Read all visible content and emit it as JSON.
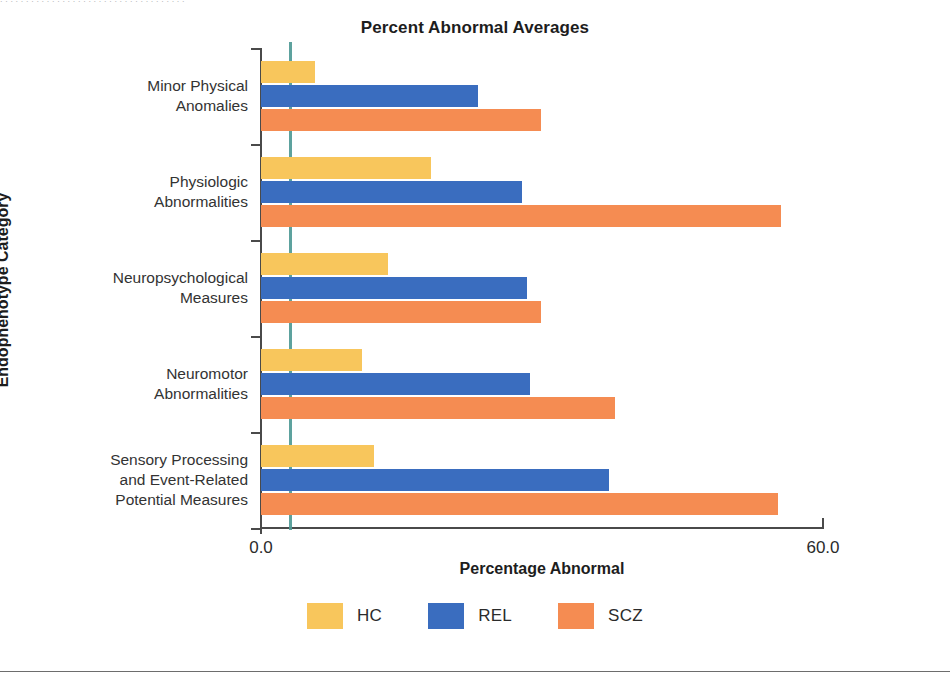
{
  "page": {
    "top_strip_text": ". . . . . . . . . . . . . . . . . . . . . . . . . . . . . . . . . . . ."
  },
  "chart_data": {
    "type": "bar",
    "orientation": "horizontal",
    "title": "Percent Abnormal Averages",
    "xlabel": "Percentage Abnormal",
    "ylabel": "Endophenotype Category",
    "xlim": [
      0.0,
      60.0
    ],
    "xticks": [
      "0.0",
      "60.0"
    ],
    "grid": false,
    "legend_position": "bottom",
    "reference_line": {
      "value": 3.1,
      "color": "#4f9a96"
    },
    "categories": [
      "Minor Physical Anomalies",
      "Physiologic Abnormalities",
      "Neuropsychological Measures",
      "Neuromotor Abnormalities",
      "Sensory Processing and Event-Related Potential Measures"
    ],
    "category_label_lines": [
      [
        "Minor Physical",
        "Anomalies"
      ],
      [
        "Physiologic",
        "Abnormalities"
      ],
      [
        "Neuropsychological",
        "Measures"
      ],
      [
        "Neuromotor",
        "Abnormalities"
      ],
      [
        "Sensory Processing",
        "and Event-Related",
        "Potential Measures"
      ]
    ],
    "series": [
      {
        "name": "HC",
        "color": "#f8c65c",
        "values": [
          5.8,
          18.2,
          13.6,
          10.8,
          12.1
        ]
      },
      {
        "name": "REL",
        "color": "#3a6dbf",
        "values": [
          23.2,
          27.9,
          28.4,
          28.7,
          37.2
        ]
      },
      {
        "name": "SCZ",
        "color": "#f58c52",
        "values": [
          29.9,
          55.5,
          29.9,
          37.8,
          55.2
        ]
      }
    ]
  },
  "legend": {
    "items": [
      {
        "label": "HC",
        "color": "#f8c65c"
      },
      {
        "label": "REL",
        "color": "#3a6dbf"
      },
      {
        "label": "SCZ",
        "color": "#f58c52"
      }
    ]
  }
}
